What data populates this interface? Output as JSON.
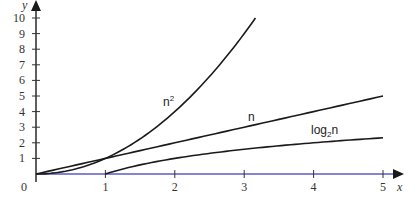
{
  "chart_data": {
    "type": "line",
    "title": "",
    "xlabel": "x",
    "ylabel": "y",
    "xlim": [
      0,
      5
    ],
    "ylim": [
      0,
      10
    ],
    "x_ticks": [
      "0",
      "1",
      "2",
      "3",
      "4",
      "5"
    ],
    "y_ticks": [
      "1",
      "2",
      "3",
      "4",
      "5",
      "6",
      "7",
      "8",
      "9",
      "10"
    ],
    "grid": false,
    "legend": "inline labels",
    "series": [
      {
        "name": "n²",
        "label_base": "n",
        "label_sup": "2",
        "function": "x^2",
        "x": [
          0,
          0.5,
          1,
          1.5,
          2,
          2.5,
          3,
          3.162
        ],
        "y": [
          0,
          0.25,
          1,
          2.25,
          4,
          6.25,
          9,
          10
        ]
      },
      {
        "name": "n",
        "label_base": "n",
        "function": "x",
        "x": [
          0,
          1,
          2,
          3,
          4,
          5
        ],
        "y": [
          0,
          1,
          2,
          3,
          4,
          5
        ]
      },
      {
        "name": "log₂n",
        "label_base": "log",
        "label_sub": "2",
        "label_tail": "n",
        "function": "log2(x)",
        "x": [
          1,
          1.5,
          2,
          2.5,
          3,
          3.5,
          4,
          4.5,
          5
        ],
        "y": [
          0,
          0.585,
          1,
          1.322,
          1.585,
          1.807,
          2,
          2.17,
          2.322
        ]
      }
    ]
  },
  "colors": {
    "axis": "#1a1a1a",
    "curve": "#1a1a1a",
    "x_axis_tint": "#6a6ad0"
  }
}
